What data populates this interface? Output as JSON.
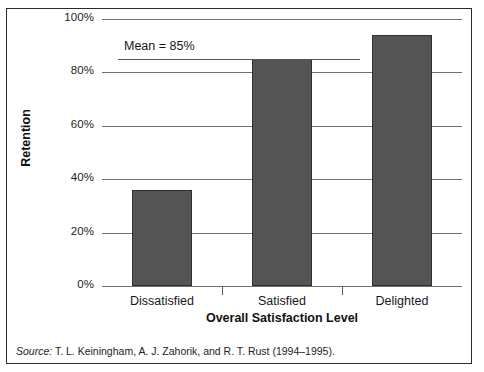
{
  "chart_data": {
    "type": "bar",
    "title": "",
    "categories": [
      "Dissatisfied",
      "Satisfied",
      "Delighted"
    ],
    "values": [
      36,
      85,
      94
    ],
    "xlabel": "Overall Satisfaction Level",
    "ylabel": "Retention",
    "ylim": [
      0,
      100
    ],
    "ytick_labels": [
      "0%",
      "20%",
      "40%",
      "60%",
      "80%",
      "100%"
    ],
    "ytick_values": [
      0,
      20,
      40,
      60,
      80,
      100
    ],
    "grid": true,
    "legend": "none",
    "annotations": [
      {
        "name": "mean-line",
        "label": "Mean = 85%",
        "value": 85
      }
    ],
    "bar_color": "#545454",
    "bar_edge_color": "#2f2f2f",
    "gridline_color": "#6f6f6f"
  },
  "source": {
    "prefix": "Source:",
    "citation": " T. L. Keiningham, A. J. Zahorik, and R. T. Rust (1994–1995)."
  },
  "title_remnant": ""
}
